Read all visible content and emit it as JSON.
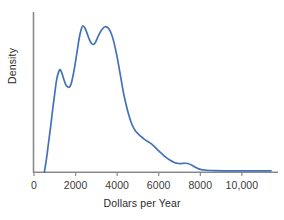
{
  "chart_data": {
    "type": "line",
    "title": "",
    "subtitle": "",
    "xlabel": "Dollars per Year",
    "ylabel": "Density",
    "grid": false,
    "legend": false,
    "legend_position": "none",
    "line_color": "#4472b8",
    "axis_color": "#8a8a8a",
    "xlim": [
      0,
      11400
    ],
    "ylim": [
      0,
      1.06
    ],
    "xticks": [
      0,
      2000,
      4000,
      6000,
      8000,
      10000
    ],
    "xtick_labels": [
      "0",
      "2000",
      "4000",
      "6000",
      "8000",
      "10,000"
    ],
    "yticks": [],
    "ytick_labels": [],
    "series": [
      {
        "name": "Density",
        "x": [
          500,
          600,
          700,
          800,
          900,
          1000,
          1100,
          1200,
          1250,
          1320,
          1420,
          1520,
          1620,
          1700,
          1780,
          1880,
          1980,
          2080,
          2180,
          2280,
          2350,
          2450,
          2550,
          2650,
          2750,
          2850,
          2950,
          3060,
          3180,
          3300,
          3420,
          3520,
          3620,
          3720,
          3820,
          3920,
          4020,
          4120,
          4220,
          4320,
          4440,
          4560,
          4700,
          4850,
          5000,
          5150,
          5300,
          5450,
          5600,
          5780,
          5960,
          6150,
          6350,
          6550,
          6750,
          6950,
          7100,
          7250,
          7400,
          7600,
          7800,
          8000,
          8300,
          8700,
          9200,
          9800,
          10400,
          11000,
          11400
        ],
        "y": [
          0.0,
          0.09,
          0.2,
          0.31,
          0.43,
          0.54,
          0.64,
          0.69,
          0.7,
          0.685,
          0.64,
          0.6,
          0.582,
          0.58,
          0.6,
          0.66,
          0.74,
          0.83,
          0.92,
          0.98,
          1.0,
          0.985,
          0.95,
          0.91,
          0.882,
          0.872,
          0.885,
          0.92,
          0.955,
          0.98,
          0.993,
          0.99,
          0.975,
          0.945,
          0.9,
          0.84,
          0.77,
          0.69,
          0.61,
          0.53,
          0.455,
          0.39,
          0.33,
          0.287,
          0.262,
          0.243,
          0.225,
          0.21,
          0.197,
          0.175,
          0.15,
          0.125,
          0.1,
          0.08,
          0.065,
          0.058,
          0.058,
          0.06,
          0.058,
          0.046,
          0.03,
          0.018,
          0.012,
          0.009,
          0.008,
          0.008,
          0.008,
          0.008,
          0.008
        ]
      }
    ],
    "annotations": []
  },
  "axis": {
    "x_title": "Dollars per Year",
    "y_title": "Density"
  }
}
